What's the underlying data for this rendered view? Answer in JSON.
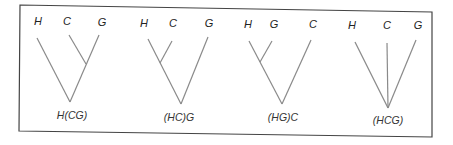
{
  "figure": {
    "panels": [
      {
        "label": "H(CG)",
        "leaves": [
          "H",
          "C",
          "G"
        ],
        "topology": "H joins (C,G)"
      },
      {
        "label": "(HC)G",
        "leaves": [
          "H",
          "C",
          "G"
        ],
        "topology": "(H,C) joins G"
      },
      {
        "label": "(HG)C",
        "leaves": [
          "H",
          "G",
          "C"
        ],
        "topology": "(H,G) joins C"
      },
      {
        "label": "(HCG)",
        "leaves": [
          "H",
          "C",
          "G"
        ],
        "topology": "unresolved trichotomy"
      }
    ],
    "colors": {
      "line": "#8a8a8a",
      "frame": "#444444",
      "text": "#222222"
    }
  }
}
